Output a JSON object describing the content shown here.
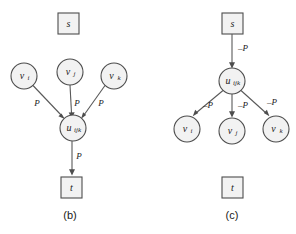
{
  "figure": {
    "background_color": "#ffffff",
    "node_fill": "#f2f2f2",
    "node_stroke": "#4d4d4d",
    "edge_color": "#595959",
    "text_color": "#1a1a1a"
  },
  "panels": [
    {
      "caption": "(b)",
      "nodes": {
        "source": {
          "label": "s",
          "shape": "square"
        },
        "v_i": {
          "label": "v",
          "sub": "i",
          "shape": "circle"
        },
        "v_j": {
          "label": "v",
          "sub": "j",
          "shape": "circle"
        },
        "v_k": {
          "label": "v",
          "sub": "k",
          "shape": "circle"
        },
        "u": {
          "label": "u",
          "sub": "ijk",
          "shape": "circle"
        },
        "sink": {
          "label": "t",
          "shape": "square"
        }
      },
      "edges": [
        {
          "from": "v_i",
          "to": "u",
          "label": "P"
        },
        {
          "from": "v_j",
          "to": "u",
          "label": "P"
        },
        {
          "from": "v_k",
          "to": "u",
          "label": "P"
        },
        {
          "from": "u",
          "to": "sink",
          "label": "P"
        }
      ]
    },
    {
      "caption": "(c)",
      "nodes": {
        "source": {
          "label": "s",
          "shape": "square"
        },
        "u": {
          "label": "u",
          "sub": "ijk",
          "shape": "circle"
        },
        "v_i": {
          "label": "v",
          "sub": "i",
          "shape": "circle"
        },
        "v_j": {
          "label": "v",
          "sub": "j",
          "shape": "circle"
        },
        "v_k": {
          "label": "v",
          "sub": "k",
          "shape": "circle"
        },
        "sink": {
          "label": "t",
          "shape": "square"
        }
      },
      "edges": [
        {
          "from": "source",
          "to": "u",
          "label": "–P"
        },
        {
          "from": "u",
          "to": "v_i",
          "label": "–P"
        },
        {
          "from": "u",
          "to": "v_j",
          "label": "–P"
        },
        {
          "from": "u",
          "to": "v_k",
          "label": "–P"
        }
      ]
    }
  ]
}
